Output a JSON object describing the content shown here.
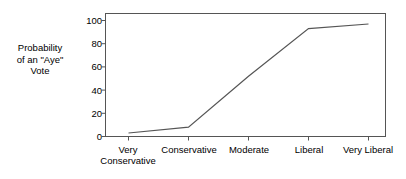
{
  "chart_data": {
    "type": "line",
    "title": "",
    "subtitle": "",
    "xlabel": "",
    "ylabel": "Probability of an \"Aye\" Vote",
    "ylabel_lines": [
      "Probability",
      "of an \"Aye\"",
      "Vote"
    ],
    "categories": [
      "Very Conservative",
      "Conservative",
      "Moderate",
      "Liberal",
      "Very Liberal"
    ],
    "category_lines": [
      [
        "Very",
        "Conservative"
      ],
      [
        "Conservative"
      ],
      [
        "Moderate"
      ],
      [
        "Liberal"
      ],
      [
        "Very Liberal"
      ]
    ],
    "values": [
      3,
      8,
      52,
      93,
      97
    ],
    "series": [
      {
        "name": "Probability of an \"Aye\" Vote",
        "values": [
          3,
          8,
          52,
          93,
          97
        ]
      }
    ],
    "ylim": [
      0,
      100
    ],
    "yticks": [
      0,
      20,
      40,
      60,
      80,
      100
    ],
    "ytick_labels": [
      "0",
      "20",
      "40",
      "60",
      "80",
      "100"
    ],
    "grid": false,
    "legend": false,
    "legend_position": "none",
    "line_color": "#555555",
    "axis_color": "#555555",
    "background_color": "#ffffff",
    "frame": true
  }
}
